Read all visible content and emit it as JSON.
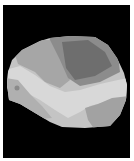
{
  "image": {
    "description": "Grayscale segmented region map on black background",
    "background_color": "#000000",
    "page_color": "#ffffff",
    "regions": [
      {
        "name": "outer-light-left",
        "color": "#c8c8c8"
      },
      {
        "name": "mid-gray-left",
        "color": "#a8a8a8"
      },
      {
        "name": "dark-top-center",
        "color": "#6e6e6e"
      },
      {
        "name": "medium-top",
        "color": "#8c8c8c"
      },
      {
        "name": "light-band",
        "color": "#d6d6d6"
      },
      {
        "name": "gray-lower-right",
        "color": "#a0a0a0"
      },
      {
        "name": "dark-spot",
        "color": "#8a8a8a"
      }
    ]
  }
}
